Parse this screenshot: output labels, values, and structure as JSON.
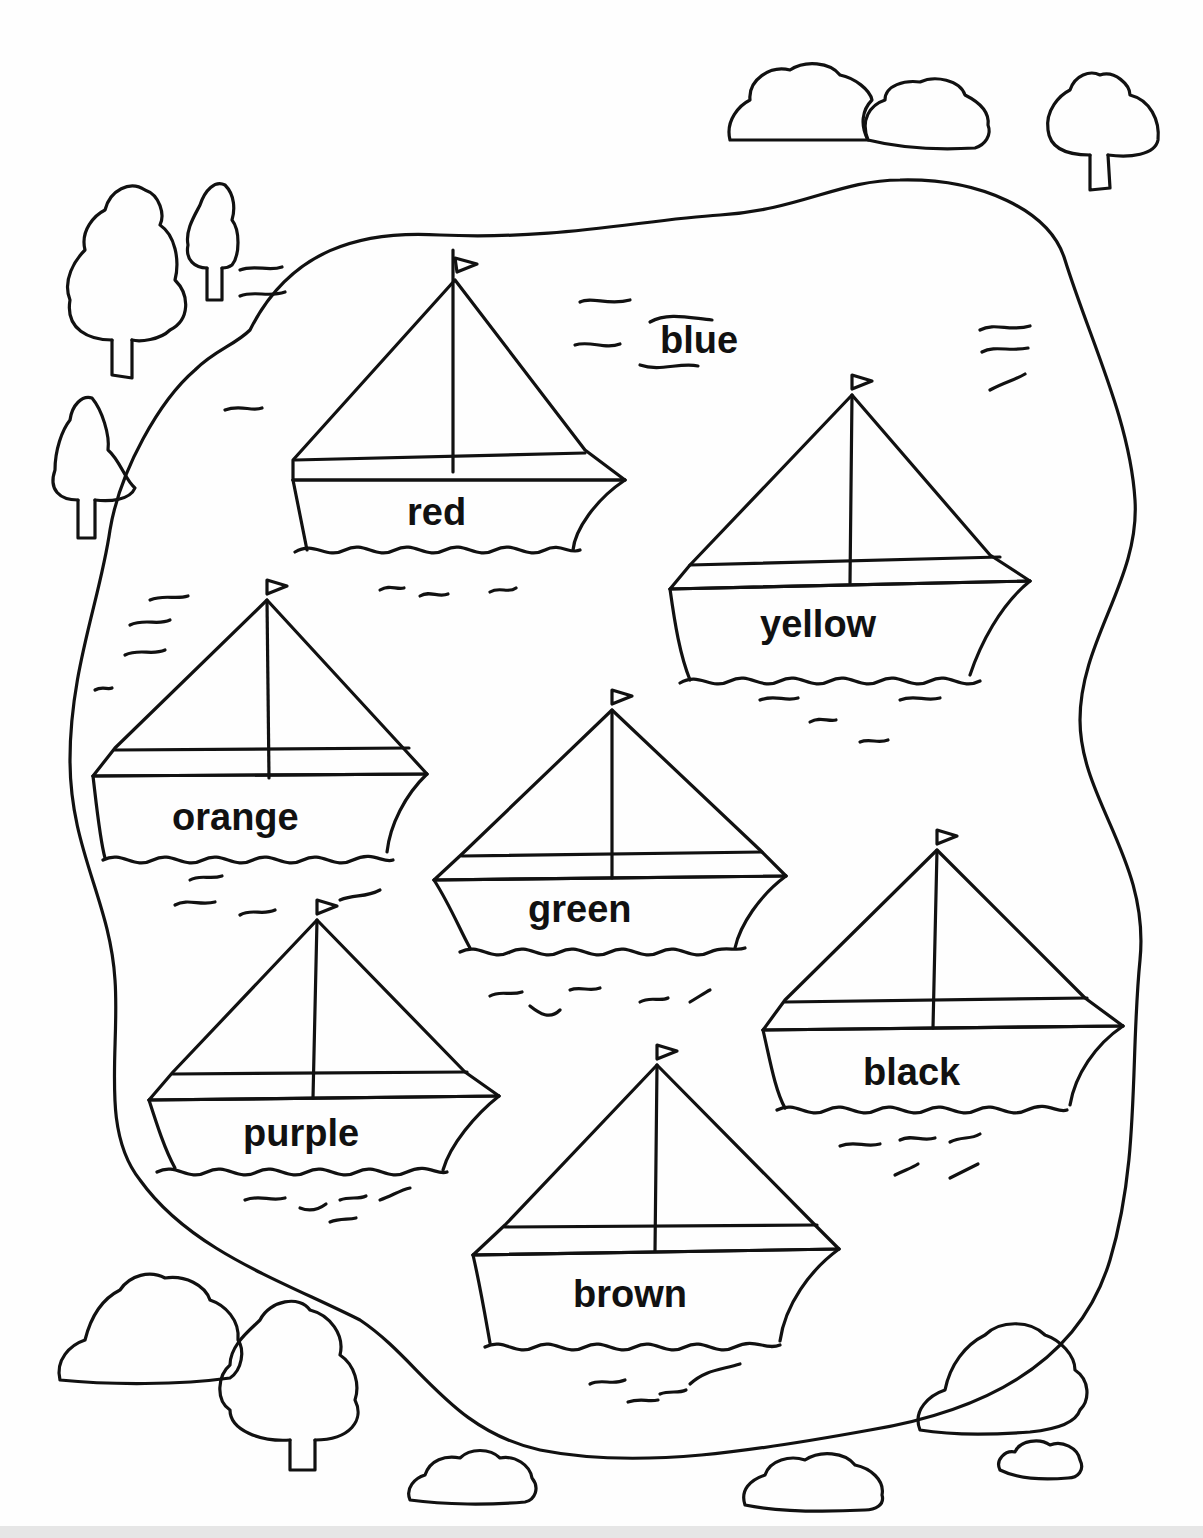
{
  "page": {
    "type": "coloring-worksheet",
    "lake_label": "blue",
    "boats": [
      {
        "label": "red",
        "x": 455,
        "y": 250
      },
      {
        "label": "yellow",
        "x": 850,
        "y": 375
      },
      {
        "label": "orange",
        "x": 265,
        "y": 580
      },
      {
        "label": "green",
        "x": 610,
        "y": 690
      },
      {
        "label": "black",
        "x": 935,
        "y": 830
      },
      {
        "label": "purple",
        "x": 315,
        "y": 900
      },
      {
        "label": "brown",
        "x": 655,
        "y": 1045
      }
    ]
  }
}
